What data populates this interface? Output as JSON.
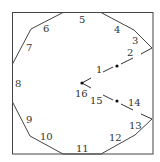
{
  "diagram": {
    "title": "",
    "edge_labels": [
      "1",
      "2",
      "3",
      "4",
      "5",
      "6",
      "7",
      "8",
      "9",
      "10",
      "11",
      "12",
      "13",
      "14",
      "15",
      "16"
    ],
    "colors": {
      "stroke": "#444444",
      "text": "#333333",
      "background": "#ffffff"
    }
  }
}
